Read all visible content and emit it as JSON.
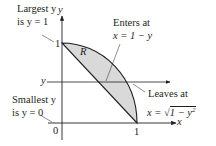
{
  "diagram": {
    "region_label": "R",
    "axis_labels": {
      "x": "x",
      "y": "y"
    },
    "ticks": {
      "origin": "0",
      "x_one": "1",
      "y_one": "1"
    },
    "horizontal_line_label": "y",
    "annotations": {
      "largest": {
        "line1": "Largest y",
        "line2": "is y = 1"
      },
      "smallest": {
        "line1": "Smallest y",
        "line2": "is y = 0"
      },
      "enters": {
        "line1": "Enters at",
        "line2": "x = 1 − y"
      },
      "leaves": {
        "line1": "Leaves at",
        "line2_prefix": "x = ",
        "line2_radicand": "1 − y",
        "line2_exp": "2"
      }
    },
    "colors": {
      "region_fill": "#d9d9d9",
      "stroke": "#231f20"
    }
  }
}
